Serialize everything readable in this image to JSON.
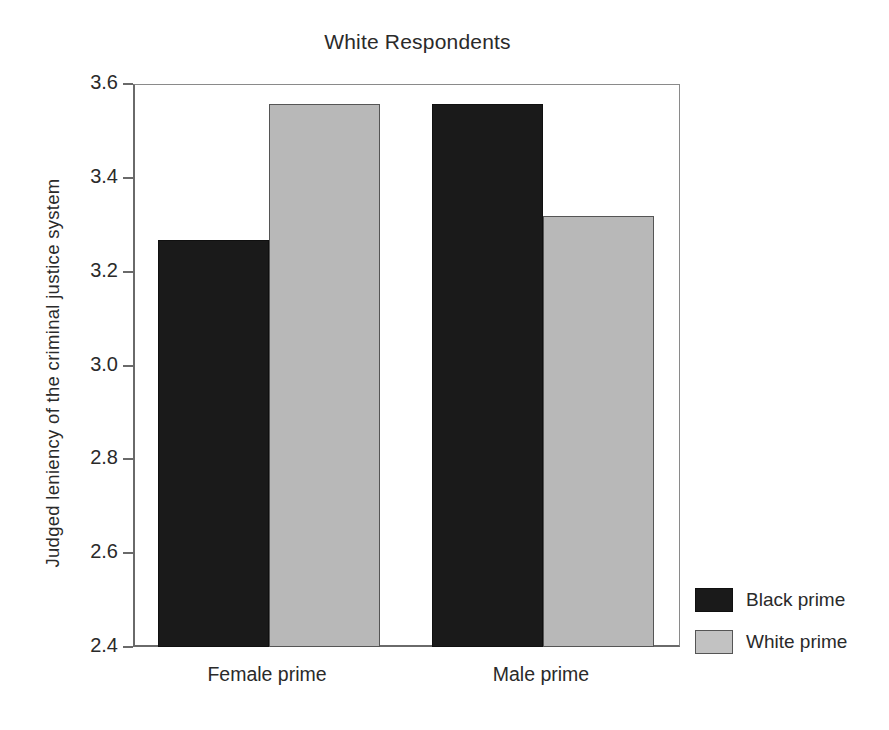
{
  "chart_data": {
    "type": "bar",
    "title": "White Respondents",
    "xlabel": "",
    "ylabel": "Judged leniency of the criminal justice system",
    "categories": [
      "Female prime",
      "Male prime"
    ],
    "series": [
      {
        "name": "Black prime",
        "color": "#1a1a1a",
        "values": [
          3.27,
          3.56
        ]
      },
      {
        "name": "White prime",
        "color": "#b8b8b8",
        "values": [
          3.56,
          3.32
        ]
      }
    ],
    "ylim": [
      2.4,
      3.6
    ],
    "ytick_values": [
      2.4,
      2.6,
      2.8,
      3.0,
      3.2,
      3.4,
      3.6
    ],
    "ytick_labels": [
      "2.4",
      "2.6",
      "2.8",
      "3.0",
      "3.2",
      "3.4",
      "3.6"
    ],
    "grid": false,
    "legend_position": "right-bottom",
    "legend_entries": [
      "Black prime",
      "White prime"
    ]
  }
}
